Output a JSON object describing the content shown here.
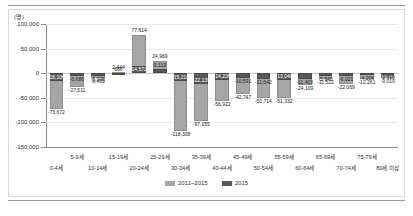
{
  "unit_label": "(명)",
  "legend": {
    "items": [
      {
        "label": "2011~2015",
        "color": "#a6a6a6",
        "key": "cum"
      },
      {
        "label": "2015",
        "color": "#595959",
        "key": "cur"
      }
    ]
  },
  "axis": {
    "y_ticks": [
      "100,000",
      "50,000",
      "0",
      "-50,000",
      "-100,000",
      "-150,000"
    ],
    "y_values": [
      100000,
      50000,
      0,
      -50000,
      -100000,
      -150000
    ],
    "ymin": -150000,
    "ymax": 100000
  },
  "chart_data": {
    "type": "bar",
    "title": "",
    "subtitle": "",
    "xlabel": "",
    "ylabel": "(명)",
    "ylim": [
      -150000,
      100000
    ],
    "grid": true,
    "legend_position": "bottom",
    "categories": [
      "0-4세",
      "5-9세",
      "10-14세",
      "15-19세",
      "20-24세",
      "25-29세",
      "30-34세",
      "35-39세",
      "40-44세",
      "45-49세",
      "50-54세",
      "55-59세",
      "60-64세",
      "65-69세",
      "70-74세",
      "75-79세",
      "80세 이상"
    ],
    "series": [
      {
        "name": "2011~2015",
        "color": "#a6a6a6",
        "values": [
          -73672,
          -27511,
          -9409,
          2444,
          77614,
          24969,
          -118308,
          -97155,
          -56922,
          -42747,
          -50714,
          -51332,
          -24109,
          -11522,
          -22069,
          -12261,
          -9019
        ],
        "labels": [
          "-73,672",
          "-27,511",
          "-9,409",
          "2,444",
          "77,614",
          "24,969",
          "-118,308",
          "-97,155",
          "-56,922",
          "-42,747",
          "-50,714",
          "-51,332",
          "-24,109",
          "-11,522",
          "-22,069",
          "-12,261",
          "-9,019"
        ]
      },
      {
        "name": "2015",
        "color": "#595959",
        "values": [
          -16106,
          -6686,
          -5098,
          886,
          14572,
          9119,
          -15210,
          -22139,
          -14236,
          -10591,
          -11642,
          -13040,
          -11403,
          -5940,
          -6021,
          -4206,
          -2519
        ],
        "labels": [
          "-16,106",
          "-6,686",
          "-5,098",
          "886",
          "14,572",
          "9,119",
          "-15,210",
          "-22,139",
          "-14,236",
          "-10,591",
          "-11,642",
          "-13,040",
          "-11,403",
          "-5,940",
          "-6,021",
          "-4,206",
          "-2,519"
        ]
      }
    ]
  }
}
